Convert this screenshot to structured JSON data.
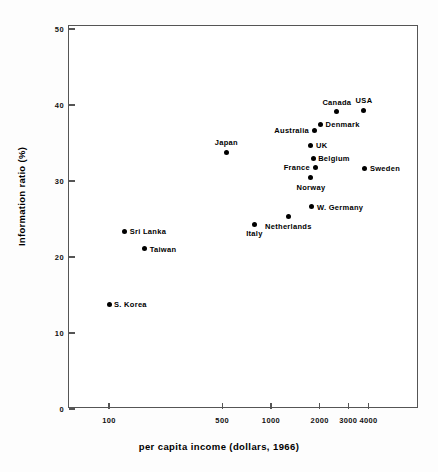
{
  "chart_data": {
    "type": "scatter",
    "title": "",
    "xlabel": "per capita income (dollars, 1966)",
    "ylabel": "Information ratio (%)",
    "xscale": "log",
    "yscale": "linear",
    "xlim": [
      75,
      6000
    ],
    "ylim": [
      0,
      50
    ],
    "grid": false,
    "legend": "none",
    "x_ticks": [
      {
        "value": 100,
        "label": "100"
      },
      {
        "value": 500,
        "label": "500"
      },
      {
        "value": 1000,
        "label": "1000"
      },
      {
        "value": 2000,
        "label": "2000"
      },
      {
        "value": 3000,
        "label": "3000"
      },
      {
        "value": 4000,
        "label": "4000"
      }
    ],
    "y_ticks": [
      {
        "value": 0,
        "label": "0"
      },
      {
        "value": 10,
        "label": "10"
      },
      {
        "value": 20,
        "label": "20"
      },
      {
        "value": 30,
        "label": "30"
      },
      {
        "value": 40,
        "label": "40"
      },
      {
        "value": 50,
        "label": "50"
      }
    ],
    "points": [
      {
        "label": "S. Korea",
        "x": 100,
        "y": 13.8,
        "label_pos": "right"
      },
      {
        "label": "Sri Lanka",
        "x": 125,
        "y": 23.4,
        "label_pos": "right"
      },
      {
        "label": "Taiwan",
        "x": 166,
        "y": 21.1,
        "label_pos": "right"
      },
      {
        "label": "Japan",
        "x": 530,
        "y": 33.8,
        "label_pos": "above"
      },
      {
        "label": "Italy",
        "x": 790,
        "y": 24.3,
        "label_pos": "below"
      },
      {
        "label": "Netherlands",
        "x": 1280,
        "y": 25.3,
        "label_pos": "below"
      },
      {
        "label": "W. Germany",
        "x": 1790,
        "y": 26.6,
        "label_pos": "right"
      },
      {
        "label": "Norway",
        "x": 1765,
        "y": 30.4,
        "label_pos": "below"
      },
      {
        "label": "France",
        "x": 1870,
        "y": 31.8,
        "label_pos": "left"
      },
      {
        "label": "Belgium",
        "x": 1820,
        "y": 33.0,
        "label_pos": "right"
      },
      {
        "label": "UK",
        "x": 1765,
        "y": 34.7,
        "label_pos": "right"
      },
      {
        "label": "Australia",
        "x": 1845,
        "y": 36.7,
        "label_pos": "left"
      },
      {
        "label": "Denmark",
        "x": 2020,
        "y": 37.5,
        "label_pos": "right"
      },
      {
        "label": "Canada",
        "x": 2550,
        "y": 39.1,
        "label_pos": "above"
      },
      {
        "label": "USA",
        "x": 3750,
        "y": 39.3,
        "label_pos": "above"
      },
      {
        "label": "Sweden",
        "x": 3800,
        "y": 31.7,
        "label_pos": "right"
      }
    ]
  },
  "axis": {
    "x_title": "per capita income (dollars, 1966)",
    "y_title": "Information ratio (%)"
  },
  "colors": {
    "marker": "#000000",
    "frame": "#555555",
    "background": "#ffffff"
  }
}
